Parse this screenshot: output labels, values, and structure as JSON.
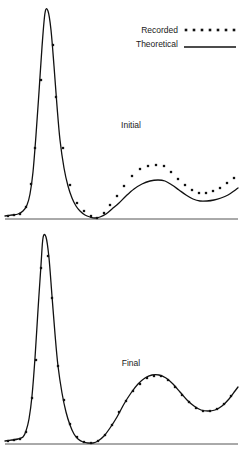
{
  "figure": {
    "width": 242,
    "height": 454,
    "background": "#ffffff",
    "ink_color": "#111111",
    "axis_color": "#4a4a4a"
  },
  "legend": {
    "position": "top-right",
    "entries": [
      {
        "label": "Recorded",
        "marker": "dotted",
        "dot_count": 7
      },
      {
        "label": "Theoretical",
        "marker": "solid-line"
      }
    ]
  },
  "chart_data": [
    {
      "type": "line",
      "title": "Initial",
      "panel": "top",
      "xlabel": "",
      "ylabel": "",
      "grid": false,
      "xlim": [
        0,
        242
      ],
      "ylim": [
        0,
        219
      ],
      "axis_baseline_y": 219,
      "axis_x_start": 5,
      "axis_x_end": 238,
      "annotations": [
        {
          "text": "Initial",
          "x": 131,
          "y": 128
        }
      ],
      "series": [
        {
          "name": "Theoretical",
          "style": "solid",
          "points": [
            [
              5,
              216
            ],
            [
              12,
              215
            ],
            [
              18,
              214
            ],
            [
              23,
              211
            ],
            [
              27,
              205
            ],
            [
              30,
              194
            ],
            [
              33,
              172
            ],
            [
              36,
              135
            ],
            [
              39,
              92
            ],
            [
              42,
              47
            ],
            [
              45,
              13
            ],
            [
              48,
              11
            ],
            [
              51,
              30
            ],
            [
              54,
              66
            ],
            [
              57,
              106
            ],
            [
              60,
              140
            ],
            [
              64,
              168
            ],
            [
              68,
              186
            ],
            [
              72,
              198
            ],
            [
              76,
              206
            ],
            [
              80,
              211
            ],
            [
              85,
              215
            ],
            [
              90,
              217
            ],
            [
              95,
              218
            ],
            [
              100,
              217
            ],
            [
              106,
              214
            ],
            [
              112,
              209
            ],
            [
              119,
              203
            ],
            [
              126,
              196
            ],
            [
              134,
              189
            ],
            [
              142,
              184
            ],
            [
              150,
              181
            ],
            [
              158,
              180
            ],
            [
              165,
              181
            ],
            [
              172,
              185
            ],
            [
              179,
              190
            ],
            [
              186,
              195
            ],
            [
              193,
              199
            ],
            [
              200,
              201
            ],
            [
              207,
              201
            ],
            [
              214,
              200
            ],
            [
              221,
              198
            ],
            [
              228,
              195
            ],
            [
              234,
              191
            ],
            [
              238,
              188
            ]
          ]
        },
        {
          "name": "Recorded",
          "style": "dots",
          "points": [
            [
              8,
              216
            ],
            [
              14,
              215
            ],
            [
              20,
              214
            ],
            [
              26,
              207
            ],
            [
              31,
              184
            ],
            [
              35,
              148
            ],
            [
              41,
              80
            ],
            [
              53,
              45
            ],
            [
              56,
              97
            ],
            [
              63,
              148
            ],
            [
              70,
              185
            ],
            [
              77,
              203
            ],
            [
              84,
              211
            ],
            [
              91,
              216
            ],
            [
              97,
              218
            ],
            [
              104,
              213
            ],
            [
              110,
              205
            ],
            [
              117,
              196
            ],
            [
              124,
              186
            ],
            [
              132,
              176
            ],
            [
              140,
              169
            ],
            [
              148,
              166
            ],
            [
              156,
              165
            ],
            [
              164,
              166
            ],
            [
              171,
              172
            ],
            [
              178,
              179
            ],
            [
              185,
              185
            ],
            [
              192,
              190
            ],
            [
              199,
              193
            ],
            [
              206,
              193
            ],
            [
              213,
              191
            ],
            [
              220,
              188
            ],
            [
              227,
              183
            ],
            [
              234,
              178
            ]
          ]
        }
      ]
    },
    {
      "type": "line",
      "title": "Final",
      "panel": "bottom",
      "xlabel": "",
      "ylabel": "",
      "grid": false,
      "xlim": [
        0,
        242
      ],
      "ylim": [
        225,
        444
      ],
      "axis_baseline_y": 444,
      "axis_x_start": 5,
      "axis_x_end": 238,
      "annotations": [
        {
          "text": "Final",
          "x": 131,
          "y": 366
        }
      ],
      "series": [
        {
          "name": "Theoretical",
          "style": "solid",
          "points": [
            [
              5,
              441
            ],
            [
              12,
              440
            ],
            [
              18,
              439
            ],
            [
              23,
              437
            ],
            [
              26,
              431
            ],
            [
              29,
              419
            ],
            [
              32,
              396
            ],
            [
              35,
              358
            ],
            [
              38,
              310
            ],
            [
              41,
              265
            ],
            [
              43,
              238
            ],
            [
              46,
              237
            ],
            [
              49,
              258
            ],
            [
              52,
              296
            ],
            [
              55,
              334
            ],
            [
              58,
              366
            ],
            [
              62,
              393
            ],
            [
              66,
              412
            ],
            [
              70,
              425
            ],
            [
              74,
              434
            ],
            [
              78,
              439
            ],
            [
              83,
              442
            ],
            [
              88,
              443
            ],
            [
              93,
              443
            ],
            [
              98,
              441
            ],
            [
              104,
              436
            ],
            [
              110,
              428
            ],
            [
              117,
              417
            ],
            [
              124,
              404
            ],
            [
              131,
              393
            ],
            [
              138,
              384
            ],
            [
              145,
              378
            ],
            [
              152,
              375
            ],
            [
              159,
              375
            ],
            [
              166,
              378
            ],
            [
              173,
              384
            ],
            [
              180,
              392
            ],
            [
              187,
              400
            ],
            [
              194,
              406
            ],
            [
              201,
              410
            ],
            [
              208,
              411
            ],
            [
              215,
              410
            ],
            [
              222,
              406
            ],
            [
              229,
              399
            ],
            [
              235,
              391
            ],
            [
              238,
              387
            ]
          ]
        },
        {
          "name": "Recorded",
          "style": "dots",
          "points": [
            [
              8,
              441
            ],
            [
              14,
              440
            ],
            [
              20,
              439
            ],
            [
              26,
              432
            ],
            [
              32,
              398
            ],
            [
              36,
              360
            ],
            [
              41,
              268
            ],
            [
              48,
              256
            ],
            [
              52,
              298
            ],
            [
              58,
              366
            ],
            [
              64,
              400
            ],
            [
              70,
              424
            ],
            [
              77,
              437
            ],
            [
              84,
              442
            ],
            [
              91,
              443
            ],
            [
              98,
              441
            ],
            [
              105,
              435
            ],
            [
              112,
              425
            ],
            [
              119,
              412
            ],
            [
              126,
              401
            ],
            [
              133,
              391
            ],
            [
              140,
              384
            ],
            [
              147,
              378
            ],
            [
              154,
              376
            ],
            [
              161,
              376
            ],
            [
              168,
              380
            ],
            [
              175,
              387
            ],
            [
              182,
              395
            ],
            [
              189,
              402
            ],
            [
              196,
              408
            ],
            [
              203,
              411
            ],
            [
              210,
              411
            ],
            [
              217,
              409
            ],
            [
              224,
              404
            ],
            [
              231,
              396
            ]
          ]
        }
      ]
    }
  ]
}
